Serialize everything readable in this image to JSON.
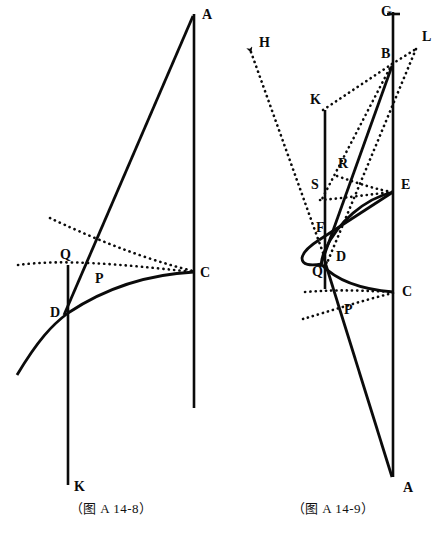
{
  "page": {
    "width": 444,
    "height": 544,
    "background": "#ffffff",
    "ink": "#0b0b0b"
  },
  "figures": [
    {
      "id": "figure-a-14-8",
      "caption": "（图 A 14-8）",
      "point_labels": [
        {
          "name": "A",
          "text": "A",
          "x": 202,
          "y": 19
        },
        {
          "name": "C",
          "text": "C",
          "x": 200,
          "y": 277
        },
        {
          "name": "Q",
          "text": "Q",
          "x": 60,
          "y": 259
        },
        {
          "name": "P",
          "text": "P",
          "x": 95,
          "y": 283
        },
        {
          "name": "D",
          "text": "D",
          "x": 50,
          "y": 317
        },
        {
          "name": "K",
          "text": "K",
          "x": 74,
          "y": 491
        }
      ],
      "solid_strokes": [
        {
          "name": "vertical-line-A-C",
          "kind": "line",
          "d": "M 194,14 L 194,408"
        },
        {
          "name": "vertical-line-D-K",
          "kind": "line",
          "d": "M 68,265 L 68,485"
        },
        {
          "name": "slant-line-A-D",
          "kind": "line",
          "d": "M 193,16 L 64,315"
        },
        {
          "name": "curve-D-C",
          "kind": "curve",
          "d": "M 17,375 C 38,340 52,325 68,313 C 110,285 155,274 194,272"
        }
      ],
      "dotted_strokes": [
        {
          "name": "dotted-upper-curve",
          "d": "M 50,218 C 88,236 140,258 193,271"
        },
        {
          "name": "dotted-lower-curve",
          "d": "M 18,265 C 62,259 120,264 193,272"
        }
      ]
    },
    {
      "id": "figure-a-14-9",
      "caption": "（图 A 14-9）",
      "point_labels": [
        {
          "name": "G",
          "text": "G",
          "x": 381,
          "y": 16
        },
        {
          "name": "L",
          "text": "L",
          "x": 422,
          "y": 41
        },
        {
          "name": "H",
          "text": "H",
          "x": 259,
          "y": 47
        },
        {
          "name": "B",
          "text": "B",
          "x": 381,
          "y": 58
        },
        {
          "name": "K",
          "text": "K",
          "x": 310,
          "y": 104
        },
        {
          "name": "R",
          "text": "R",
          "x": 338,
          "y": 168
        },
        {
          "name": "S",
          "text": "S",
          "x": 311,
          "y": 189
        },
        {
          "name": "E",
          "text": "E",
          "x": 401,
          "y": 189
        },
        {
          "name": "F",
          "text": "F",
          "x": 316,
          "y": 232
        },
        {
          "name": "D",
          "text": "D",
          "x": 336,
          "y": 261
        },
        {
          "name": "Q",
          "text": "Q",
          "x": 312,
          "y": 276
        },
        {
          "name": "C",
          "text": "C",
          "x": 402,
          "y": 296
        },
        {
          "name": "P",
          "text": "P",
          "x": 344,
          "y": 314
        },
        {
          "name": "A",
          "text": "A",
          "x": 403,
          "y": 492
        }
      ],
      "solid_strokes": [
        {
          "name": "vertical-line-G-A",
          "kind": "line",
          "d": "M 393,12 L 393,477"
        },
        {
          "name": "tick-at-G",
          "kind": "line",
          "d": "M 387,14 L 400,14"
        },
        {
          "name": "vertical-line-K-Q",
          "kind": "line",
          "d": "M 325,110 L 325,289"
        },
        {
          "name": "slant-line-B-Q",
          "kind": "line",
          "d": "M 392,66 L 320,267"
        },
        {
          "name": "slant-line-D-A",
          "kind": "line",
          "d": "M 325,262 L 392,477"
        },
        {
          "name": "segment-F-E",
          "kind": "line",
          "d": "M 319,240 L 393,192"
        },
        {
          "name": "curve-F-D-left",
          "kind": "curve",
          "d": "M 319,240 C 308,247 303,252 302,258 C 302,265 310,266 322,264"
        },
        {
          "name": "curve-E-Q-right",
          "kind": "curve",
          "d": "M 393,192 C 364,199 338,222 325,250 C 322,257 321,262 322,265"
        },
        {
          "name": "curve-Q-C",
          "kind": "curve",
          "d": "M 322,265 C 335,279 358,289 393,292"
        }
      ],
      "dotted_strokes": [
        {
          "name": "dotted-H-to-D",
          "d": "M 251,52 L 327,264"
        },
        {
          "name": "dotted-K-to-B",
          "d": "M 323,110 L 392,64"
        },
        {
          "name": "dotted-B-to-L",
          "d": "M 392,64 L 416,49"
        },
        {
          "name": "dotted-L-to-D",
          "d": "M 416,49 L 327,263"
        },
        {
          "name": "dotted-B-to-S",
          "d": "M 392,64 L 322,199"
        },
        {
          "name": "dotted-R-to-E",
          "d": "M 337,176 C 360,184 378,190 393,192"
        },
        {
          "name": "dotted-S-curve",
          "d": "M 320,200 C 346,198 372,194 393,192"
        },
        {
          "name": "dotted-upper-C",
          "d": "M 305,292 C 340,289 370,291 393,292"
        },
        {
          "name": "dotted-lower-P",
          "d": "M 303,319 C 330,311 364,300 393,293"
        }
      ]
    }
  ]
}
